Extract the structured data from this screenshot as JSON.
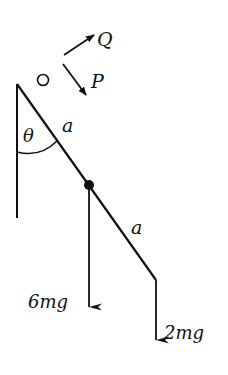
{
  "diagram": {
    "type": "statics-rod-diagram",
    "labels": {
      "pivot": "O",
      "force_q": "Q",
      "force_p": "P",
      "angle": "θ",
      "upper_segment": "a",
      "lower_segment": "a",
      "load_middle": "6mg",
      "load_end": "2mg"
    },
    "colors": {
      "ink": "#111111",
      "background": "#ffffff"
    },
    "geometry": {
      "pivot": [
        17,
        84
      ],
      "midpoint": [
        89,
        185
      ],
      "rod_end": [
        156,
        280
      ],
      "wall_bottom": [
        17,
        218
      ]
    }
  }
}
